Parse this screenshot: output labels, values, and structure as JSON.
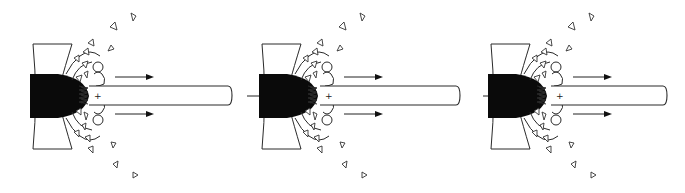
{
  "diagram": {
    "type": "process-sequence",
    "stage_count": 3,
    "colors": {
      "ink": "#2a2a2a",
      "solid_body": "#0a0a0a",
      "background": "#ffffff"
    },
    "stages": [
      {
        "id": 1,
        "offset_x": 0,
        "tube_end_x": 232,
        "charge_symbol": "+"
      },
      {
        "id": 2,
        "offset_x": 229,
        "tube_end_x": 460,
        "charge_symbol": "+"
      },
      {
        "id": 3,
        "offset_x": 458,
        "tube_end_x": 667,
        "charge_symbol": "+"
      }
    ],
    "transition_arrows": [
      {
        "from": 1,
        "to": 2
      },
      {
        "from": 2,
        "to": 3
      }
    ],
    "elements": {
      "solid_body": "black-dome",
      "channel": "tube",
      "interface": "zigzag-spring",
      "bubbles": "circles",
      "fragments": "open-triangles",
      "flow_arrows": "right-pointing"
    }
  }
}
